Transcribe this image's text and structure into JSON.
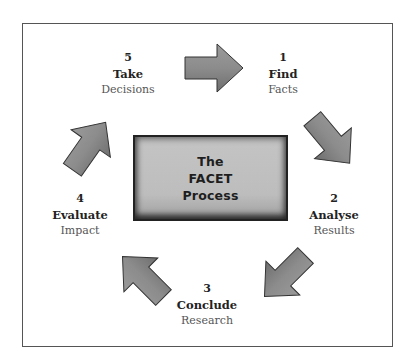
{
  "diagram": {
    "title_lines": [
      "The",
      "FACET",
      "Process"
    ],
    "steps": [
      {
        "number": "1",
        "verb": "Find",
        "noun": "Facts"
      },
      {
        "number": "2",
        "verb": "Analyse",
        "noun": "Results"
      },
      {
        "number": "3",
        "verb": "Conclude",
        "noun": "Research"
      },
      {
        "number": "4",
        "verb": "Evaluate",
        "noun": "Impact"
      },
      {
        "number": "5",
        "verb": "Take",
        "noun": "Decisions"
      }
    ],
    "arrows": [
      {
        "from": "5",
        "to": "1",
        "direction": "right"
      },
      {
        "from": "1",
        "to": "2",
        "direction": "down-right"
      },
      {
        "from": "2",
        "to": "3",
        "direction": "down-left"
      },
      {
        "from": "3",
        "to": "4",
        "direction": "up-left"
      },
      {
        "from": "4",
        "to": "5",
        "direction": "up-right"
      }
    ],
    "colors": {
      "frame": "#555555",
      "box_fill": "#bfbfbf",
      "arrow_fill": "#8a8a8a",
      "text": "#222222"
    }
  }
}
